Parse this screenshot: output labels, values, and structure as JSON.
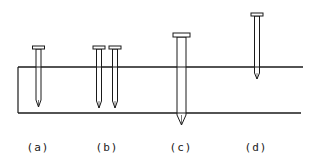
{
  "figure": {
    "stroke_color": "#1a1a1a",
    "background": "#ffffff",
    "board": {
      "top_y": 67,
      "bottom_y": 113,
      "left_x": 18,
      "top_right_x": 303,
      "bottom_right_x": 301
    },
    "panels": [
      {
        "id": "a",
        "label": "(a)",
        "label_x": 38,
        "description": "single nail partially driven into board"
      },
      {
        "id": "b",
        "label": "(b)",
        "label_x": 107,
        "description": "two nails side by side partially driven"
      },
      {
        "id": "c",
        "label": "(c)",
        "label_x": 181,
        "description": "larger nail passing fully through board"
      },
      {
        "id": "d",
        "label": "(d)",
        "label_x": 256,
        "description": "nail barely penetrating board surface"
      }
    ],
    "nails": [
      {
        "panel": "a",
        "cx": 38.5,
        "head_y": 46,
        "head_w": 12,
        "shank_w": 5,
        "shank_end": 100,
        "tip_y": 107
      },
      {
        "panel": "b",
        "cx": 99,
        "head_y": 46,
        "head_w": 12,
        "shank_w": 5,
        "shank_end": 101,
        "tip_y": 108
      },
      {
        "panel": "b",
        "cx": 115,
        "head_y": 46,
        "head_w": 12,
        "shank_w": 5,
        "shank_end": 101,
        "tip_y": 108
      },
      {
        "panel": "c",
        "cx": 181.5,
        "head_y": 33,
        "head_w": 17,
        "shank_w": 9,
        "shank_end": 115,
        "tip_y": 125
      },
      {
        "panel": "d",
        "cx": 257,
        "head_y": 13,
        "head_w": 12,
        "shank_w": 5,
        "shank_end": 73,
        "tip_y": 79
      }
    ]
  }
}
